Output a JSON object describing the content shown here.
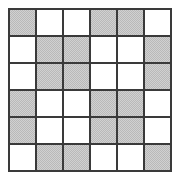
{
  "figure": {
    "kind": "shaded-grid-pattern",
    "rows": 6,
    "columns": 6,
    "shaded_label": "shaded",
    "unshaded_label": "unshaded",
    "shaded_count": 18,
    "unshaded_count": 18
  },
  "colors": {
    "shaded_fill": "#b9b9b9",
    "unshaded_fill": "#ffffff",
    "grid_line": "#3a3a3a",
    "background": "#ffffff"
  },
  "chart_data": {
    "type": "heatmap",
    "title": "",
    "xlabel": "",
    "ylabel": "",
    "grid": true,
    "legend": null,
    "categories_x": [
      "1",
      "2",
      "3",
      "4",
      "5",
      "6"
    ],
    "categories_y": [
      "1",
      "2",
      "3",
      "4",
      "5",
      "6"
    ],
    "value_legend": {
      "0": "unshaded",
      "1": "shaded"
    },
    "values": [
      [
        1,
        0,
        0,
        1,
        1,
        0
      ],
      [
        0,
        1,
        1,
        0,
        0,
        1
      ],
      [
        0,
        1,
        1,
        0,
        0,
        1
      ],
      [
        1,
        0,
        0,
        1,
        1,
        0
      ],
      [
        1,
        0,
        0,
        1,
        1,
        0
      ],
      [
        0,
        1,
        1,
        0,
        0,
        1
      ]
    ]
  }
}
